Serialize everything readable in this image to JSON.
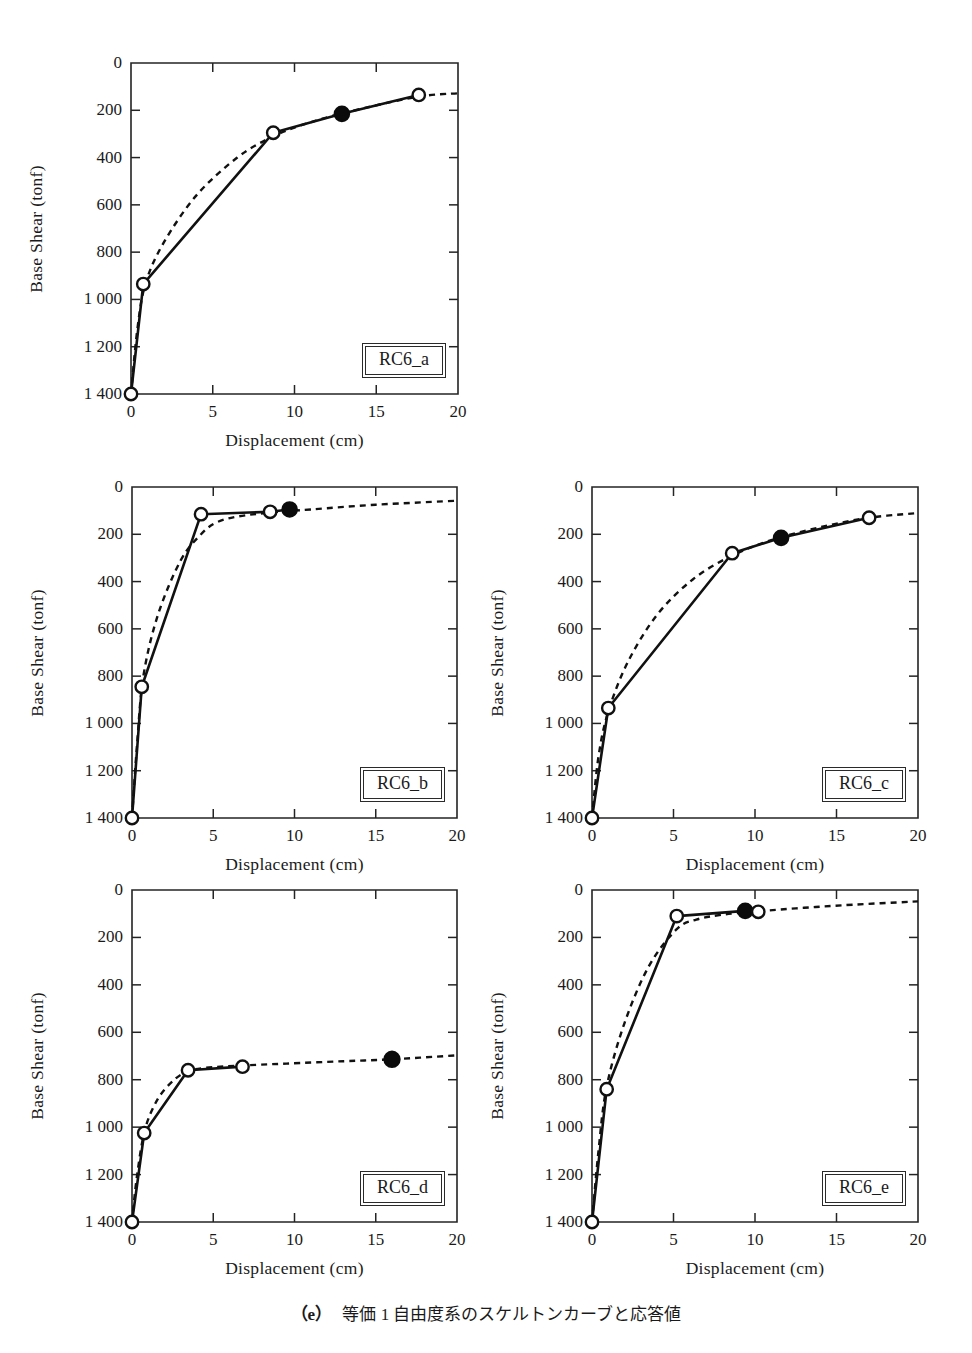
{
  "figure": {
    "caption_tag": "（e）",
    "caption_text": "等価 1 自由度系のスケルトンカーブと応答値",
    "axis_labels": {
      "x": "Displacement (cm)",
      "y": "Base Shear (tonf)"
    },
    "xticks": [
      "0",
      "5",
      "10",
      "15",
      "20"
    ],
    "yticks": [
      "1 400",
      "1 200",
      "1 000",
      "800",
      "600",
      "400",
      "200",
      "0"
    ],
    "colors": {
      "line": "#111111",
      "frame": "#242424",
      "marker_open_fill": "#ffffff",
      "marker_filled": "#0b0b0b",
      "background": "#ffffff"
    }
  },
  "chart_data": [
    {
      "type": "line",
      "title": "RC6_a",
      "xlabel": "Displacement (cm)",
      "ylabel": "Base Shear (tonf)",
      "xlim": [
        0,
        20
      ],
      "ylim": [
        0,
        1400
      ],
      "xticks": [
        0,
        5,
        10,
        15,
        20
      ],
      "yticks": [
        0,
        200,
        400,
        600,
        800,
        1000,
        1200,
        1400
      ],
      "grid": false,
      "legend": "none",
      "series": [
        {
          "name": "skeleton curve",
          "style": "solid-with-open-markers",
          "x": [
            0.0,
            0.75,
            8.7,
            12.9,
            17.6
          ],
          "y": [
            0,
            465,
            1105,
            1185,
            1265
          ],
          "markers": [
            "open",
            "open",
            "open",
            "filled",
            "open"
          ]
        },
        {
          "name": "equivalent smooth curve",
          "style": "dashed",
          "x": [
            0.0,
            0.4,
            0.9,
            2.0,
            4.0,
            6.5,
            8.7,
            11.0,
            14.0,
            17.6,
            20.0
          ],
          "y": [
            0,
            280,
            470,
            640,
            840,
            1000,
            1090,
            1150,
            1205,
            1258,
            1272
          ]
        }
      ],
      "response_point": {
        "x": 12.9,
        "y": 1185
      }
    },
    {
      "type": "line",
      "title": "RC6_b",
      "xlabel": "Displacement (cm)",
      "ylabel": "Base Shear (tonf)",
      "xlim": [
        0,
        20
      ],
      "ylim": [
        0,
        1400
      ],
      "xticks": [
        0,
        5,
        10,
        15,
        20
      ],
      "yticks": [
        0,
        200,
        400,
        600,
        800,
        1000,
        1200,
        1400
      ],
      "grid": false,
      "legend": "none",
      "series": [
        {
          "name": "skeleton curve",
          "style": "solid-with-open-markers",
          "x": [
            0.0,
            0.6,
            4.25,
            8.5,
            9.7
          ],
          "y": [
            0,
            555,
            1285,
            1295,
            1305
          ],
          "markers": [
            "open",
            "open",
            "open",
            "open",
            "filled"
          ]
        },
        {
          "name": "equivalent smooth curve",
          "style": "dashed",
          "x": [
            0.0,
            0.3,
            0.7,
            1.6,
            3.0,
            4.25,
            5.2,
            6.5,
            8.5,
            11.0,
            15.0,
            20.0
          ],
          "y": [
            0,
            300,
            600,
            860,
            1090,
            1200,
            1250,
            1275,
            1292,
            1305,
            1325,
            1342
          ]
        }
      ],
      "response_point": {
        "x": 9.7,
        "y": 1305
      }
    },
    {
      "type": "line",
      "title": "RC6_c",
      "xlabel": "Displacement (cm)",
      "ylabel": "Base Shear (tonf)",
      "xlim": [
        0,
        20
      ],
      "ylim": [
        0,
        1400
      ],
      "xticks": [
        0,
        5,
        10,
        15,
        20
      ],
      "yticks": [
        0,
        200,
        400,
        600,
        800,
        1000,
        1200,
        1400
      ],
      "grid": false,
      "legend": "none",
      "series": [
        {
          "name": "skeleton curve",
          "style": "solid-with-open-markers",
          "x": [
            0.0,
            1.0,
            8.6,
            11.6,
            17.0
          ],
          "y": [
            0,
            465,
            1120,
            1185,
            1270
          ],
          "markers": [
            "open",
            "open",
            "open",
            "filled",
            "open"
          ]
        },
        {
          "name": "equivalent smooth curve",
          "style": "dashed",
          "x": [
            0.0,
            0.4,
            1.0,
            2.2,
            4.0,
            6.2,
            8.6,
            11.0,
            14.0,
            17.0,
            20.0
          ],
          "y": [
            0,
            260,
            450,
            660,
            860,
            1010,
            1110,
            1175,
            1230,
            1270,
            1290
          ]
        }
      ],
      "response_point": {
        "x": 11.6,
        "y": 1185
      }
    },
    {
      "type": "line",
      "title": "RC6_d",
      "xlabel": "Displacement (cm)",
      "ylabel": "Base Shear (tonf)",
      "xlim": [
        0,
        20
      ],
      "ylim": [
        0,
        1400
      ],
      "xticks": [
        0,
        5,
        10,
        15,
        20
      ],
      "yticks": [
        0,
        200,
        400,
        600,
        800,
        1000,
        1200,
        1400
      ],
      "grid": false,
      "legend": "none",
      "series": [
        {
          "name": "skeleton curve",
          "style": "solid-with-open-markers",
          "x": [
            0.0,
            0.75,
            3.45,
            6.8
          ],
          "y": [
            0,
            375,
            640,
            655
          ],
          "markers": [
            "open",
            "open",
            "open",
            "open"
          ]
        },
        {
          "name": "equivalent smooth curve",
          "style": "dashed",
          "x": [
            0.0,
            0.3,
            0.8,
            1.6,
            2.6,
            3.45,
            4.5,
            6.8,
            9.5,
            13.0,
            16.0,
            20.0
          ],
          "y": [
            0,
            190,
            390,
            520,
            600,
            635,
            650,
            660,
            668,
            678,
            686,
            703
          ]
        }
      ],
      "response_point": {
        "x": 16.0,
        "y": 686
      }
    },
    {
      "type": "line",
      "title": "RC6_e",
      "xlabel": "Displacement (cm)",
      "ylabel": "Base Shear (tonf)",
      "xlim": [
        0,
        20
      ],
      "ylim": [
        0,
        1400
      ],
      "xticks": [
        0,
        5,
        10,
        15,
        20
      ],
      "yticks": [
        0,
        200,
        400,
        600,
        800,
        1000,
        1200,
        1400
      ],
      "grid": false,
      "legend": "none",
      "series": [
        {
          "name": "skeleton curve",
          "style": "solid-with-open-markers",
          "x": [
            0.0,
            0.9,
            5.2,
            9.4,
            10.2
          ],
          "y": [
            0,
            560,
            1290,
            1312,
            1308
          ],
          "markers": [
            "open",
            "open",
            "open",
            "filled",
            "open"
          ]
        },
        {
          "name": "equivalent smooth curve",
          "style": "dashed",
          "x": [
            0.0,
            0.4,
            0.9,
            2.0,
            3.5,
            5.2,
            6.4,
            8.0,
            10.2,
            13.0,
            16.0,
            20.0
          ],
          "y": [
            0,
            300,
            570,
            840,
            1080,
            1235,
            1275,
            1296,
            1310,
            1325,
            1338,
            1352
          ]
        }
      ],
      "response_point": {
        "x": 9.4,
        "y": 1312
      }
    }
  ]
}
